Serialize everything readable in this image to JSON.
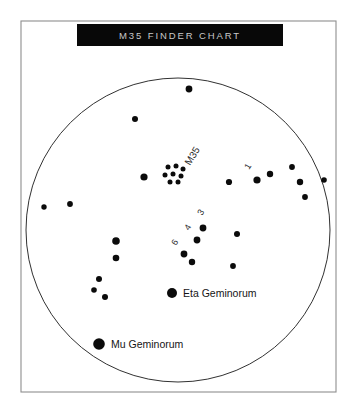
{
  "page": {
    "background_color": "#ffffff",
    "width": 356,
    "height": 412
  },
  "frame": {
    "stroke_color": "#8e8e8e",
    "x": 21,
    "y": 21,
    "width": 315,
    "height": 371
  },
  "title": {
    "text": "M35 FINDER CHART",
    "band_color": "#080808",
    "text_color": "#c9c9c9",
    "band_x": 77,
    "band_y": 24,
    "band_width": 206,
    "band_height": 22
  },
  "sky": {
    "label": "sky-field",
    "center_x": 178,
    "center_y": 230,
    "radius": 152,
    "stroke_color": "#1a1a1a",
    "fill_color": "#ffffff"
  },
  "legend": {
    "entries": [
      {
        "name": "Eta Geminorum",
        "dot_x": 172,
        "dot_y": 293,
        "dot_r": 5.0,
        "text_x": 183,
        "text_y": 297
      },
      {
        "name": "Mu Geminorum",
        "dot_x": 99,
        "dot_y": 344,
        "dot_r": 5.8,
        "text_x": 111,
        "text_y": 348
      }
    ]
  },
  "chart_data": {
    "type": "scatter",
    "title": "M35 FINDER CHART",
    "subtitle": "",
    "xlabel": "",
    "ylabel": "",
    "grid": false,
    "legend_position": "in-field",
    "projection": "circular sky field",
    "field_circle": {
      "center_x": 178,
      "center_y": 230,
      "radius": 152
    },
    "cluster": {
      "name": "M35",
      "label_x": 190,
      "label_y": 166,
      "label_rotation": -58,
      "member_dots": [
        {
          "x": 168,
          "y": 167,
          "r": 2.5
        },
        {
          "x": 176,
          "y": 166,
          "r": 2.5
        },
        {
          "x": 183,
          "y": 169,
          "r": 2.5
        },
        {
          "x": 165,
          "y": 175,
          "r": 2.5
        },
        {
          "x": 173,
          "y": 174,
          "r": 2.5
        },
        {
          "x": 181,
          "y": 176,
          "r": 2.5
        },
        {
          "x": 170,
          "y": 182,
          "r": 2.5
        },
        {
          "x": 178,
          "y": 182,
          "r": 2.5
        }
      ]
    },
    "labeled_stars": [
      {
        "label": "1",
        "x": 257,
        "y": 180,
        "r": 3.6,
        "label_x": 249,
        "label_y": 170,
        "label_rotation": -58
      },
      {
        "label": "3",
        "x": 203,
        "y": 228,
        "r": 3.4,
        "label_x": 202,
        "label_y": 216,
        "label_rotation": -58
      },
      {
        "label": "4",
        "x": 197,
        "y": 240,
        "r": 3.4,
        "label_x": 189,
        "label_y": 231,
        "label_rotation": -58
      },
      {
        "label": "6",
        "x": 184,
        "y": 254,
        "r": 3.4,
        "label_x": 176,
        "label_y": 246,
        "label_rotation": -58
      }
    ],
    "named_stars": [
      {
        "label": "Eta Geminorum",
        "x": 172,
        "y": 293,
        "r": 5.0
      },
      {
        "label": "Mu Geminorum",
        "x": 99,
        "y": 344,
        "r": 5.8
      }
    ],
    "field_stars": [
      {
        "x": 189,
        "y": 89,
        "r": 3.4
      },
      {
        "x": 135,
        "y": 119,
        "r": 3.0
      },
      {
        "x": 70,
        "y": 204,
        "r": 2.9
      },
      {
        "x": 44,
        "y": 207,
        "r": 2.7
      },
      {
        "x": 116,
        "y": 241,
        "r": 3.8
      },
      {
        "x": 116,
        "y": 258,
        "r": 3.3
      },
      {
        "x": 99,
        "y": 279,
        "r": 3.0
      },
      {
        "x": 94,
        "y": 290,
        "r": 2.8
      },
      {
        "x": 105,
        "y": 297,
        "r": 3.0
      },
      {
        "x": 144,
        "y": 177,
        "r": 3.6
      },
      {
        "x": 229,
        "y": 182,
        "r": 3.1
      },
      {
        "x": 270,
        "y": 174,
        "r": 3.2
      },
      {
        "x": 292,
        "y": 167,
        "r": 2.9
      },
      {
        "x": 300,
        "y": 182,
        "r": 3.2
      },
      {
        "x": 324,
        "y": 180,
        "r": 2.8
      },
      {
        "x": 305,
        "y": 197,
        "r": 2.9
      },
      {
        "x": 237,
        "y": 234,
        "r": 3.0
      },
      {
        "x": 233,
        "y": 266,
        "r": 2.9
      },
      {
        "x": 192,
        "y": 262,
        "r": 3.2
      }
    ]
  }
}
